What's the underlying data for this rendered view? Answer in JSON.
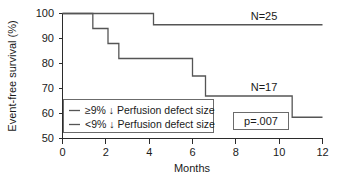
{
  "chart_data": {
    "type": "line",
    "plot_style": "kaplan-meier step survival curves",
    "title": "",
    "xlabel": "Months",
    "ylabel": "Event-free survival (%)",
    "xlim": [
      0,
      12
    ],
    "ylim": [
      50,
      100
    ],
    "xticks": [
      0,
      2,
      4,
      6,
      8,
      10,
      12
    ],
    "xtick_labels": [
      "0",
      "2",
      "4",
      "6",
      "8",
      "10",
      "12"
    ],
    "yticks": [
      50,
      60,
      70,
      80,
      90,
      100
    ],
    "ytick_labels": [
      "50",
      "60",
      "70",
      "80",
      "90",
      "100"
    ],
    "grid": false,
    "legend_position": "lower left inside axes",
    "series": [
      {
        "name": "≥9% ↓ Perfusion defect size",
        "n_label": "N=25",
        "color": "#555555",
        "steps": [
          {
            "x": 0.0,
            "y": 100.0
          },
          {
            "x": 4.2,
            "y": 100.0
          },
          {
            "x": 4.2,
            "y": 95.5
          },
          {
            "x": 12.0,
            "y": 95.5
          }
        ]
      },
      {
        "name": "<9% ↓ Perfusion defect size",
        "n_label": "N=17",
        "color": "#555555",
        "steps": [
          {
            "x": 0.0,
            "y": 100.0
          },
          {
            "x": 1.4,
            "y": 100.0
          },
          {
            "x": 1.4,
            "y": 94.0
          },
          {
            "x": 2.1,
            "y": 94.0
          },
          {
            "x": 2.1,
            "y": 88.0
          },
          {
            "x": 2.6,
            "y": 88.0
          },
          {
            "x": 2.6,
            "y": 82.0
          },
          {
            "x": 6.0,
            "y": 82.0
          },
          {
            "x": 6.0,
            "y": 75.0
          },
          {
            "x": 6.6,
            "y": 75.0
          },
          {
            "x": 6.6,
            "y": 67.0
          },
          {
            "x": 10.6,
            "y": 67.0
          },
          {
            "x": 10.6,
            "y": 58.5
          },
          {
            "x": 12.0,
            "y": 58.5
          }
        ]
      }
    ],
    "annotations": [
      {
        "text": "N=25",
        "x": 9.3,
        "y": 99.0
      },
      {
        "text": "N=17",
        "x": 9.3,
        "y": 70.5
      },
      {
        "text": "p=.007",
        "x": 9.5,
        "y": 55.5,
        "boxed": true
      }
    ]
  },
  "legend": {
    "entries": [
      {
        "label": "≥9% ↓ Perfusion defect size"
      },
      {
        "label": "<9% ↓ Perfusion defect size"
      }
    ]
  },
  "pvalue": {
    "label": "p=.007"
  },
  "group_labels": {
    "upper": "N=25",
    "lower": "N=17"
  }
}
